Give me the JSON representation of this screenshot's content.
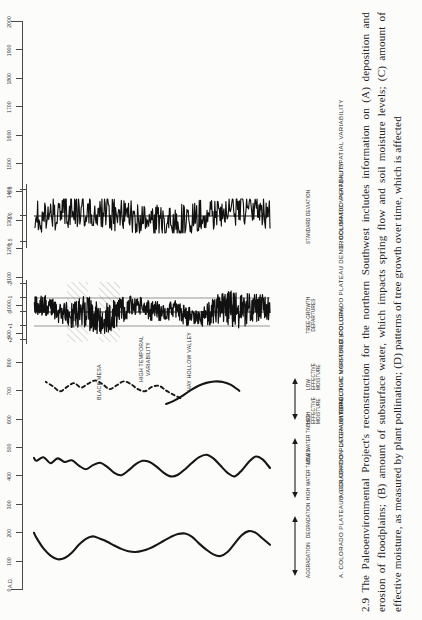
{
  "figure": {
    "number": "2.9",
    "caption": "2.9 The Paleoenvironmental Project's reconstruction for the northern Southwest includes information on (A) deposition and erosion of floodplains; (B) amount of subsurface water, which impacts spring flow and soil moisture levels; (C) amount of effective moisture, as measured by plant pollination; (D) patterns of tree growth over time, which is affected"
  },
  "time_axis": {
    "era_label": "A.D.",
    "ticks": [
      0,
      100,
      200,
      300,
      400,
      500,
      600,
      700,
      800,
      900,
      1000,
      1100,
      1200,
      1300,
      1400,
      1500,
      1600,
      1700,
      1800,
      1900,
      2000
    ],
    "tick_labels": [
      "0",
      "100",
      "200",
      "300",
      "400",
      "500",
      "600",
      "700",
      "800",
      "900",
      "1000",
      "1100",
      "1200",
      "1300",
      "1400",
      "1500",
      "1600",
      "1700",
      "1800",
      "1900",
      "2000"
    ],
    "min": 0,
    "max": 2000
  },
  "panels": [
    {
      "id": "A",
      "title": "A. COLORADO PLATEAU AGGRADATION-DEGRADATION",
      "direction_labels": [
        "AGGRADATION",
        "DEGRADATION"
      ],
      "annotations": []
    },
    {
      "id": "B",
      "title": "B. COLORADO PLATEAU HYDROLOGIC VARIABILITY",
      "direction_labels": [
        "HIGH WATER TABLES",
        "LOW WATER TABLES"
      ],
      "annotations": []
    },
    {
      "id": "C",
      "title": "C. EFFECTIVE MOISTURE (POLLEN)",
      "direction_labels": [
        "HIGH EFFECTIVE MOISTURE",
        "LOW EFFECTIVE MOISTURE"
      ],
      "annotations": [
        "HAY HOLLOW VALLEY",
        "BLACK MESA"
      ]
    },
    {
      "id": "D",
      "title": "D. COLORADO PLATEAU DENDROCLIMATIC VARIABILITY",
      "axis_label": "TREE-GROWTH DEPARTURES",
      "scale_labels": [
        "+2",
        "+1",
        "0",
        "-1",
        "-2"
      ],
      "annotations": [
        "HIGH TEMPORAL VARIABILITY"
      ]
    },
    {
      "id": "E",
      "title": "E. COLORADO PLATEAU SPATIAL VARIABILITY",
      "axis_label": "STANDARD DEVIATION",
      "scale_labels": [
        "1.5",
        "1.0",
        "0.5"
      ],
      "annotations": []
    }
  ],
  "chart_data": {
    "type": "line",
    "xlabel": "A.D.",
    "xlim": [
      0,
      2000
    ],
    "grid": false,
    "legend": "none",
    "orientation": "vertical-time-axis",
    "panels": [
      {
        "id": "A",
        "name": "Colorado Plateau Aggradation-Degradation",
        "ylabel": "Aggradation ↔ Degradation",
        "style": "solid-smooth",
        "x": [
          0,
          60,
          120,
          180,
          240,
          300,
          360,
          420,
          480,
          540,
          600,
          660,
          720,
          780,
          840,
          900,
          960,
          1020,
          1080,
          1140,
          1200,
          1260,
          1320,
          1380,
          1440,
          1500,
          1560,
          1620,
          1680,
          1740,
          1800,
          1860,
          1920,
          1980,
          2000
        ],
        "y": [
          0.05,
          0.3,
          0.55,
          0.62,
          0.45,
          0.1,
          -0.25,
          -0.42,
          -0.35,
          -0.15,
          0.1,
          0.38,
          0.52,
          0.5,
          0.38,
          0.22,
          0.05,
          -0.1,
          -0.2,
          -0.25,
          -0.22,
          -0.12,
          0.02,
          0.18,
          0.3,
          0.4,
          0.3,
          0.05,
          -0.28,
          -0.5,
          -0.55,
          -0.4,
          -0.1,
          0.35,
          0.55
        ]
      },
      {
        "id": "B",
        "name": "Colorado Plateau Hydrologic Variability",
        "ylabel": "High water tables ↔ Low water tables",
        "style": "solid-smooth",
        "x": [
          0,
          60,
          120,
          180,
          240,
          300,
          360,
          420,
          480,
          540,
          600,
          660,
          720,
          780,
          840,
          900,
          960,
          1020,
          1080,
          1140,
          1200,
          1260,
          1320,
          1380,
          1440,
          1500,
          1560,
          1620,
          1680,
          1740,
          1800,
          1860,
          1920,
          1980,
          2000
        ],
        "y": [
          0.0,
          0.35,
          0.48,
          0.25,
          -0.1,
          -0.35,
          -0.2,
          0.1,
          0.4,
          0.55,
          0.45,
          0.22,
          -0.05,
          -0.28,
          -0.35,
          -0.2,
          0.05,
          0.25,
          0.3,
          0.15,
          -0.1,
          -0.3,
          -0.2,
          0.05,
          0.22,
          0.12,
          -0.05,
          0.1,
          0.32,
          0.25,
          0.4,
          0.2,
          0.45,
          0.3,
          0.42
        ]
      },
      {
        "id": "C",
        "name": "Effective Moisture (Pollen)",
        "ylabel": "High effective moisture ↔ Low effective moisture",
        "series": [
          {
            "name": "HAY HOLLOW VALLEY",
            "style": "solid",
            "x": [
              260,
              330,
              400,
              470,
              540,
              610,
              680,
              750,
              820,
              880
            ],
            "y": [
              0.05,
              0.3,
              0.42,
              0.44,
              0.38,
              0.25,
              0.05,
              -0.18,
              -0.38,
              -0.5
            ]
          },
          {
            "name": "BLACK MESA",
            "style": "dashed",
            "x": [
              760,
              820,
              880,
              940,
              1000,
              1060,
              1120,
              1180,
              1240,
              1300,
              1360,
              1420,
              1480,
              1540,
              1600,
              1660,
              1720,
              1780,
              1840,
              1900
            ],
            "y": [
              -0.46,
              -0.3,
              -0.12,
              0.1,
              0.05,
              -0.15,
              -0.05,
              0.18,
              0.3,
              0.12,
              -0.05,
              0.18,
              0.34,
              0.2,
              0.02,
              0.22,
              0.05,
              -0.15,
              0.08,
              0.28
            ]
          }
        ]
      },
      {
        "id": "D",
        "name": "Colorado Plateau Dendroclimatic Variability",
        "ylabel": "Tree-growth departures",
        "ylim": [
          -2,
          2
        ],
        "yticks": [
          2,
          1,
          0,
          -1,
          -2
        ],
        "style": "solid-highfreq",
        "shaded_intervals": [
          [
            1270,
            1450
          ],
          [
            1540,
            1720
          ]
        ],
        "annotation": "HIGH TEMPORAL VARIABILITY"
      },
      {
        "id": "E",
        "name": "Colorado Plateau Spatial Variability",
        "ylabel": "Standard deviation",
        "ylim": [
          0.5,
          1.5
        ],
        "yticks": [
          1.5,
          1.0,
          0.5
        ],
        "style": "solid-highfreq",
        "shaded_intervals": [
          [
            1340,
            1420
          ]
        ]
      }
    ]
  }
}
